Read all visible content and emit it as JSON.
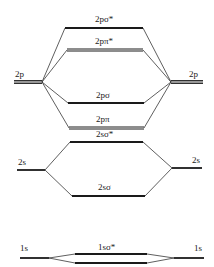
{
  "diagram": {
    "type": "molecular-orbital-energy-diagram",
    "atomic_orbitals": {
      "left": [
        {
          "label": "2p"
        },
        {
          "label": "2s"
        },
        {
          "label": "1s"
        }
      ],
      "right": [
        {
          "label": "2p"
        },
        {
          "label": "2s"
        },
        {
          "label": "1s"
        }
      ]
    },
    "molecular_orbitals": [
      {
        "label": "2pσ*"
      },
      {
        "label": "2pπ*"
      },
      {
        "label": "2pσ"
      },
      {
        "label": "2pπ"
      },
      {
        "label": "2sσ*"
      },
      {
        "label": "2sσ"
      },
      {
        "label": "1sσ*"
      }
    ],
    "colors": {
      "line": "#1a1a1a",
      "background": "#ffffff"
    }
  }
}
